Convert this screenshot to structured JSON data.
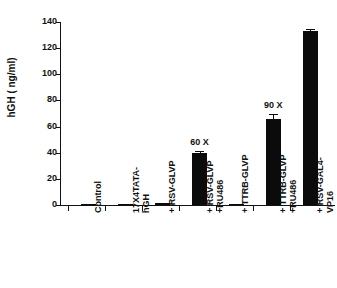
{
  "chart_data": {
    "type": "bar",
    "title": "",
    "xlabel": "",
    "ylabel": "hGH ( ng/ml)",
    "ylim": [
      0,
      140
    ],
    "yticks": [
      0,
      20,
      40,
      60,
      80,
      100,
      120,
      140
    ],
    "ytick_labels": [
      "0",
      "20",
      "40",
      "60",
      "80",
      "100",
      "120",
      "140"
    ],
    "grid": false,
    "legend": "none",
    "bar_color": "#0b0b0b",
    "categories": [
      "Control",
      "17X4TATA-\nhGH",
      "+ RSV-GLVP",
      "+ RSV-GLVP\n+RU486",
      "+ TTRB-GLVP",
      "+ TTRB-GLVP\n+RU486",
      "+ RSV-GAL4-\nVP16"
    ],
    "values": [
      0.2,
      0.2,
      1.2,
      40,
      1.0,
      66,
      133
    ],
    "errors": [
      0,
      0,
      0,
      1.5,
      0,
      4,
      1.5
    ],
    "annotations": [
      "",
      "",
      "",
      "60 X",
      "",
      "90 X",
      ""
    ]
  },
  "axis": {
    "y_title": "hGH ( ng/ml)"
  }
}
